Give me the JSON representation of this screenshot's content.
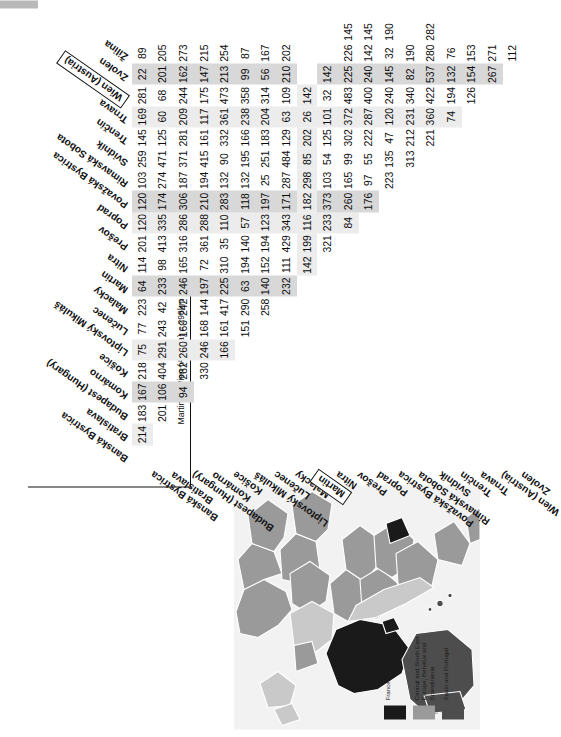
{
  "figure": {
    "annotation": "Martin to Wien (Austria) = 298km",
    "highlighted_row": "Martin",
    "highlighted_col": "Wien (Austria)"
  },
  "map": {
    "title": "",
    "legend": [
      {
        "label": "France and Andorra",
        "color": "#1a1a1a"
      },
      {
        "label": "Central and South East Europe, Benelux and Scandinavia",
        "color": "#9a9a9a"
      },
      {
        "label": "Spain and Portugal",
        "color": "#4d4d4d"
      }
    ],
    "background": "#f2f2f2",
    "land_light": "#c9c9c9",
    "land_mid": "#9a9a9a",
    "land_dark": "#4d4d4d",
    "land_black": "#1a1a1a"
  },
  "chart_data": {
    "type": "table",
    "categories": [
      "Banská Bystrica",
      "Bratislava",
      "Budapest (Hungary)",
      "Komárno",
      "Košice",
      "Liptovský Mikuláš",
      "Lučenec",
      "Malacky",
      "Martin",
      "Nitra",
      "Prešov",
      "Poprad",
      "Považská Bystrica",
      "Rimavská Sobota",
      "Svidník",
      "Trenčín",
      "Trnava",
      "Wien (Austria)",
      "Zvolen",
      "Žilina"
    ],
    "rows": [
      {
        "label": "Banská Bystrica",
        "values": [
          214,
          183,
          167,
          218,
          75,
          77,
          223,
          64,
          114,
          201,
          120,
          120,
          103,
          259,
          145,
          169,
          281,
          22,
          89
        ]
      },
      {
        "label": "Bratislava",
        "values": [
          201,
          106,
          404,
          291,
          243,
          42,
          233,
          98,
          413,
          335,
          174,
          274,
          471,
          125,
          60,
          68,
          201,
          205
        ]
      },
      {
        "label": "Budapest (Hungary)",
        "values": [
          94,
          282,
          260,
          160,
          242,
          246,
          165,
          316,
          286,
          306,
          187,
          371,
          281,
          209,
          244,
          162,
          273
        ]
      },
      {
        "label": "Komárno",
        "values": [
          330,
          246,
          168,
          144,
          197,
          72,
          361,
          288,
          210,
          194,
          415,
          161,
          117,
          175,
          147,
          215
        ]
      },
      {
        "label": "Košice",
        "values": [
          166,
          161,
          417,
          225,
          310,
          35,
          110,
          283,
          132,
          90,
          332,
          361,
          473,
          213,
          254
        ]
      },
      {
        "label": "Liptovský Mikuláš",
        "values": [
          151,
          290,
          63,
          194,
          140,
          57,
          118,
          132,
          195,
          166,
          238,
          358,
          99,
          87
        ]
      },
      {
        "label": "Lučenec",
        "values": [
          258,
          140,
          152,
          194,
          123,
          197,
          25,
          251,
          183,
          204,
          314,
          56,
          167
        ]
      },
      {
        "label": "Malacky",
        "values": [
          232,
          111,
          429,
          343,
          171,
          287,
          484,
          129,
          63,
          109,
          210,
          202
        ]
      },
      {
        "label": "Martin",
        "values": [
          142,
          199,
          116,
          182,
          298,
          85,
          202,
          26,
          142
        ]
      },
      {
        "label": "Nitra",
        "values": [
          321,
          233,
          373,
          103,
          54,
          125,
          101,
          32,
          142
        ]
      },
      {
        "label": "Prešov",
        "values": [
          84,
          260,
          165,
          99,
          302,
          372,
          483,
          225,
          226,
          145
        ]
      },
      {
        "label": "Poprad",
        "values": [
          176,
          97,
          55,
          222,
          287,
          400,
          240,
          142,
          145
        ]
      },
      {
        "label": "Považská Bystrica",
        "values": [
          223,
          135,
          47,
          120,
          240,
          145,
          32,
          190
        ]
      },
      {
        "label": "Rimavská Sobota",
        "values": [
          313,
          212,
          231,
          340,
          82,
          190
        ]
      },
      {
        "label": "Svidník",
        "values": [
          221,
          360,
          422,
          537,
          280,
          282
        ]
      },
      {
        "label": "Trenčín",
        "values": [
          74,
          194,
          132,
          76
        ]
      },
      {
        "label": "Trnava",
        "values": [
          126,
          154,
          153
        ]
      },
      {
        "label": "Wien (Austria)",
        "values": [
          267,
          271
        ]
      },
      {
        "label": "Zvolen",
        "values": [
          112
        ]
      }
    ],
    "matrix_columns": [
      "Banská Bystrica",
      "Bratislava",
      "Budapest (Hungary)",
      "Komárno",
      "Košice",
      "Liptovský Mikuláš",
      "Lučenec",
      "Malacky",
      "Martin",
      "Nitra",
      "Prešov",
      "Poprad",
      "Považská Bystrica",
      "Rimavská Sobota",
      "Svidník",
      "Trenčín",
      "Trnava",
      "Wien (Austria)",
      "Zvolen",
      "Žilina"
    ],
    "note": "Lower-triangular symmetric road distance matrix; units kilometres.",
    "units": "km"
  }
}
